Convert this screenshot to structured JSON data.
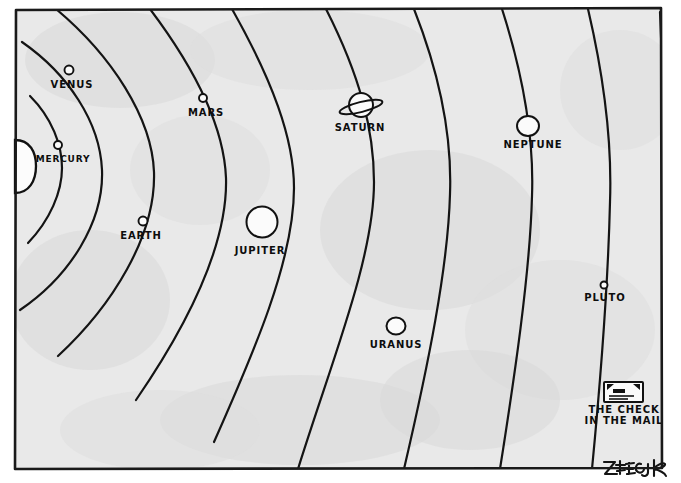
{
  "cartoon": {
    "title": "Solar System Cartoon",
    "artist_signature": "ZIEGLER",
    "background_color": "#e9e9e9",
    "ink_color": "#111111",
    "frame": {
      "x": 14,
      "y": 8,
      "width": 649,
      "height": 462
    },
    "sun": {
      "name": "SUN",
      "cx": 2,
      "cy": 166,
      "r": 26,
      "labeled": false
    },
    "planets": [
      {
        "name": "MERCURY",
        "cx": 58,
        "cy": 145,
        "r": 4.0,
        "label_x": 63,
        "label_y": 162,
        "label_size": "small",
        "has_rings": false
      },
      {
        "name": "VENUS",
        "cx": 69,
        "cy": 70,
        "r": 4.5,
        "label_x": 72,
        "label_y": 88,
        "label_size": "normal",
        "has_rings": false
      },
      {
        "name": "EARTH",
        "cx": 143,
        "cy": 221,
        "r": 4.5,
        "label_x": 141,
        "label_y": 239,
        "label_size": "normal",
        "has_rings": false
      },
      {
        "name": "MARS",
        "cx": 203,
        "cy": 98,
        "r": 4.0,
        "label_x": 206,
        "label_y": 116,
        "label_size": "normal",
        "has_rings": false
      },
      {
        "name": "JUPITER",
        "cx": 262,
        "cy": 222,
        "r": 15.5,
        "label_x": 260,
        "label_y": 254,
        "label_size": "normal",
        "has_rings": false
      },
      {
        "name": "SATURN",
        "cx": 361,
        "cy": 105,
        "r": 12.0,
        "label_x": 360,
        "label_y": 131,
        "label_size": "normal",
        "has_rings": true
      },
      {
        "name": "URANUS",
        "cx": 396,
        "cy": 326,
        "r": 9.0,
        "label_x": 396,
        "label_y": 348,
        "label_size": "normal",
        "has_rings": false
      },
      {
        "name": "NEPTUNE",
        "cx": 528,
        "cy": 126,
        "r": 10.5,
        "label_x": 533,
        "label_y": 148,
        "label_size": "normal",
        "has_rings": false
      },
      {
        "name": "PLUTO",
        "cx": 604,
        "cy": 285,
        "r": 3.5,
        "label_x": 605,
        "label_y": 301,
        "label_size": "normal",
        "has_rings": false
      }
    ],
    "caption_object": {
      "line1": "THE CHECK",
      "line2": "IN THE MAIL",
      "envelope_x": 604,
      "envelope_y": 382,
      "envelope_width": 39,
      "envelope_height": 20,
      "label_x": 624,
      "label_y": 413
    },
    "orbit_count": 10
  }
}
